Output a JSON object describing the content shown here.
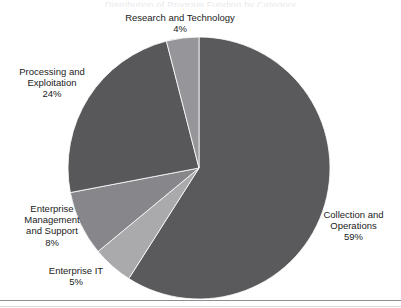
{
  "figure": {
    "clipped_title": "Distribution of Program Funding by Category",
    "background_color": "#ffffff",
    "rule_color": "#8f8f93"
  },
  "chart_data": {
    "type": "pie",
    "title": "",
    "xlabel": "",
    "ylabel": "",
    "legend_position": "none",
    "grid": false,
    "units": "percent",
    "start_angle_deg": 0,
    "direction": "clockwise",
    "center": {
      "x": 199,
      "y": 168
    },
    "radius": 131,
    "categories": [
      "Collection and Operations",
      "Enterprise IT",
      "Enterprise Management and Support",
      "Processing and Exploitation",
      "Research and Technology"
    ],
    "values": [
      59,
      5,
      8,
      24,
      4
    ],
    "colors": [
      "#5a5a5c",
      "#aaaaac",
      "#87878b",
      "#58585a",
      "#96969a"
    ],
    "slices": [
      {
        "name": "Collection and Operations",
        "value": 59,
        "color": "#5a5a5c",
        "label_lines": [
          "Collection and",
          "Operations"
        ],
        "percent_text": "59%"
      },
      {
        "name": "Enterprise IT",
        "value": 5,
        "color": "#aaaaac",
        "label_lines": [
          "Enterprise IT"
        ],
        "percent_text": "5%"
      },
      {
        "name": "Enterprise Management and Support",
        "value": 8,
        "color": "#87878b",
        "label_lines": [
          "Enterprise",
          "Management",
          "and Support"
        ],
        "percent_text": "8%"
      },
      {
        "name": "Processing and Exploitation",
        "value": 24,
        "color": "#58585a",
        "label_lines": [
          "Processing and",
          "Exploitation"
        ],
        "percent_text": "24%"
      },
      {
        "name": "Research and Technology",
        "value": 4,
        "color": "#96969a",
        "label_lines": [
          "Research and Technology"
        ],
        "percent_text": "4%"
      }
    ]
  },
  "labels": {
    "research": {
      "name": "Research and Technology",
      "pct": "4%"
    },
    "processing": {
      "line1": "Processing and",
      "line2": "Exploitation",
      "pct": "24%"
    },
    "entmgmt": {
      "line1": "Enterprise",
      "line2": "Management",
      "line3": "and Support",
      "pct": "8%"
    },
    "entit": {
      "name": "Enterprise IT",
      "pct": "5%"
    },
    "collection": {
      "line1": "Collection and",
      "line2": "Operations",
      "pct": "59%"
    }
  }
}
